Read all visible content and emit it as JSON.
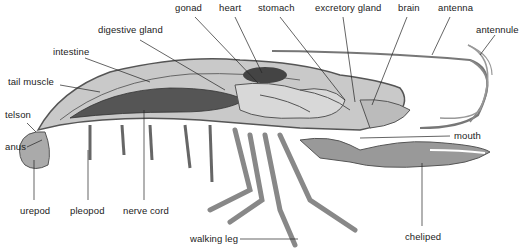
{
  "figure": {
    "labels": [
      {
        "id": "gonad",
        "text": "gonad",
        "x": 175,
        "y": 3
      },
      {
        "id": "heart",
        "text": "heart",
        "x": 219,
        "y": 3
      },
      {
        "id": "stomach",
        "text": "stomach",
        "x": 258,
        "y": 3
      },
      {
        "id": "excretory-gland",
        "text": "excretory gland",
        "x": 315,
        "y": 3
      },
      {
        "id": "brain",
        "text": "brain",
        "x": 398,
        "y": 3
      },
      {
        "id": "antenna",
        "text": "antenna",
        "x": 438,
        "y": 3
      },
      {
        "id": "antennule",
        "text": "antennule",
        "x": 476,
        "y": 25
      },
      {
        "id": "digestive-gland",
        "text": "digestive gland",
        "x": 98,
        "y": 25
      },
      {
        "id": "intestine",
        "text": "intestine",
        "x": 53,
        "y": 47
      },
      {
        "id": "tail-muscle",
        "text": "tail muscle",
        "x": 8,
        "y": 77
      },
      {
        "id": "telson",
        "text": "telson",
        "x": 5,
        "y": 110
      },
      {
        "id": "anus",
        "text": "anus",
        "x": 5,
        "y": 142
      },
      {
        "id": "mouth",
        "text": "mouth",
        "x": 454,
        "y": 131
      },
      {
        "id": "urepod",
        "text": "urepod",
        "x": 20,
        "y": 206
      },
      {
        "id": "pleopod",
        "text": "pleopod",
        "x": 70,
        "y": 206
      },
      {
        "id": "nerve-cord",
        "text": "nerve cord",
        "x": 123,
        "y": 206
      },
      {
        "id": "walking-leg",
        "text": "walking leg",
        "x": 190,
        "y": 234
      },
      {
        "id": "cheliped",
        "text": "cheliped",
        "x": 405,
        "y": 232
      }
    ]
  }
}
